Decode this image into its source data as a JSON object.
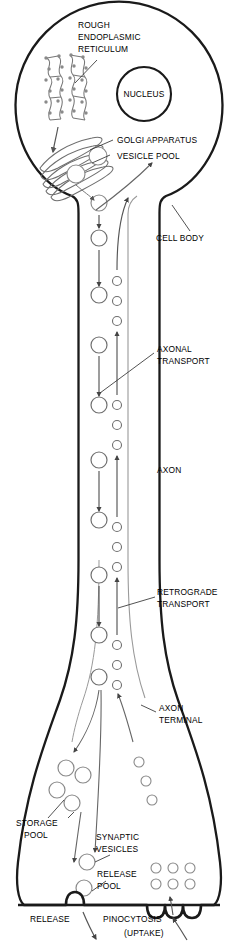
{
  "figure": {
    "type": "biological-diagram",
    "background_color": "#ffffff",
    "line_color": "#1a1a1a",
    "organelle_line_color": "#6b6b6b",
    "arrow_color": "#555555"
  },
  "labels": {
    "rough_er_line1": "ROUGH",
    "rough_er_line2": "ENDOPLASMIC",
    "rough_er_line3": "RETICULUM",
    "nucleus": "NUCLEUS",
    "golgi": "GOLGI APPARATUS",
    "vesicle_pool": "VESICLE POOL",
    "cell_body": "CELL BODY",
    "axonal_transport_line1": "AXONAL",
    "axonal_transport_line2": "TRANSPORT",
    "axon": "AXON",
    "retrograde_line1": "RETROGRADE",
    "retrograde_line2": "TRANSPORT",
    "axon_terminal_line1": "AXON",
    "axon_terminal_line2": "TERMINAL",
    "storage_pool_line1": "STORAGE",
    "storage_pool_line2": "POOL",
    "synaptic_vesicles_line1": "SYNAPTIC",
    "synaptic_vesicles_line2": "VESICLES",
    "release_pool_line1": "RELEASE",
    "release_pool_line2": "POOL",
    "release": "RELEASE",
    "pinocytosis_line1": "PINOCYTOSIS",
    "pinocytosis_line2": "(UPTAKE)"
  },
  "structures": {
    "soma": {
      "center_x": 119,
      "center_y": 105,
      "radius": 104
    },
    "nucleus": {
      "center_x": 144,
      "center_y": 94,
      "radius": 27
    },
    "axon": {
      "left_wall_x": 78,
      "right_wall_x": 128,
      "top_y": 200,
      "bottom_y": 690
    },
    "terminal": {
      "top_y": 690,
      "bottom_y": 905,
      "left_x": 16,
      "right_x": 222
    }
  },
  "transport": {
    "anterograde_label": "anterograde (large vesicles, downward)",
    "anterograde_vesicle_x": 99,
    "anterograde_vesicle_radius": 8,
    "anterograde_vesicle_y": [
      203,
      238,
      295,
      345,
      405,
      460,
      520,
      575,
      635,
      675
    ],
    "retrograde_label": "retrograde (small vesicles, upward)",
    "retrograde_vesicle_x": 117,
    "retrograde_vesicle_radius": 4.5,
    "retrograde_vesicle_y": [
      281,
      301,
      321,
      405,
      425,
      445,
      527,
      547,
      567,
      645,
      665,
      685
    ]
  },
  "terminal_contents": {
    "storage_pool_vesicles": [
      {
        "x": 66,
        "y": 768,
        "r": 8
      },
      {
        "x": 83,
        "y": 775,
        "r": 8
      },
      {
        "x": 57,
        "y": 790,
        "r": 8
      },
      {
        "x": 72,
        "y": 803,
        "r": 8
      }
    ],
    "synaptic_vesicles": [
      {
        "x": 87,
        "y": 862,
        "r": 8
      },
      {
        "x": 84,
        "y": 888,
        "r": 8
      }
    ],
    "uptake_vesicles": [
      {
        "x": 139,
        "y": 762,
        "r": 5
      },
      {
        "x": 146,
        "y": 781,
        "r": 5
      },
      {
        "x": 152,
        "y": 800,
        "r": 5
      }
    ],
    "pinocytosis_grid": [
      {
        "x": 156,
        "y": 868,
        "r": 5
      },
      {
        "x": 173,
        "y": 868,
        "r": 5
      },
      {
        "x": 190,
        "y": 868,
        "r": 5
      },
      {
        "x": 156,
        "y": 884,
        "r": 5
      },
      {
        "x": 173,
        "y": 884,
        "r": 5
      },
      {
        "x": 190,
        "y": 884,
        "r": 5
      }
    ],
    "vesicle_pool_soma": [
      {
        "x": 98,
        "y": 156,
        "r": 9
      },
      {
        "x": 76,
        "y": 174,
        "r": 9
      },
      {
        "x": 99,
        "y": 203,
        "r": 8
      }
    ]
  },
  "membrane": {
    "release_site_x": 75,
    "release_site_label": "exocytosis bump",
    "pinocytosis_pits_x": [
      157,
      174,
      191
    ],
    "pinocytosis_pit_label": "membrane invagination"
  }
}
